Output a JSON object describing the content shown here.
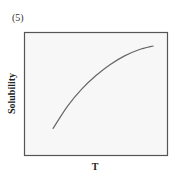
{
  "panel": {
    "label": "(5)"
  },
  "chart_data": {
    "type": "line",
    "title": "",
    "xlabel": "T",
    "ylabel": "Solubility",
    "x_ticks": [],
    "y_ticks": [],
    "grid": false,
    "legend": null,
    "series": [
      {
        "name": "Solubility vs T",
        "x": [
          0.2,
          0.3,
          0.4,
          0.5,
          0.6,
          0.7,
          0.8,
          0.9
        ],
        "y": [
          0.22,
          0.4,
          0.54,
          0.65,
          0.74,
          0.81,
          0.86,
          0.89
        ]
      }
    ],
    "xlim": [
      0,
      1
    ],
    "ylim": [
      0,
      1
    ]
  },
  "colors": {
    "frame": "#555555",
    "plot_background": "#f7f7f7",
    "curve": "#666666"
  }
}
